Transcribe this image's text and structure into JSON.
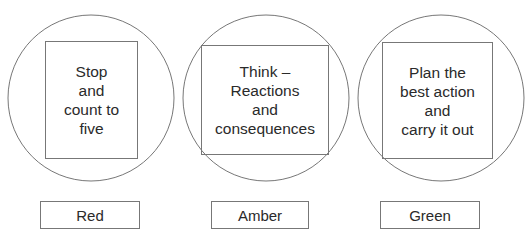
{
  "stages": [
    {
      "text": "Stop\nand\ncount to\nfive",
      "label": "Red"
    },
    {
      "text": "Think –\nReactions\nand\nconsequences",
      "label": "Amber"
    },
    {
      "text": "Plan the\nbest action\nand\ncarry it out",
      "label": "Green"
    }
  ]
}
